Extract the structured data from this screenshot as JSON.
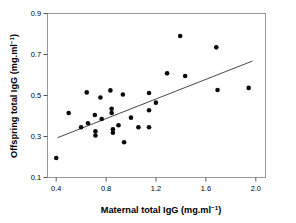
{
  "chart_data": {
    "type": "scatter",
    "title": "",
    "xlabel": "Maternal total IgG (mg.ml-1)",
    "xlabel_main": "Maternal total IgG (mg.ml",
    "xlabel_sup": "−1",
    "xlabel_tail": ")",
    "ylabel": "Offspring total IgG (mg.ml-1)",
    "ylabel_main": "Offspring total IgG (mg.ml",
    "ylabel_sup": "−1",
    "ylabel_tail": ")",
    "xlim": [
      0.33,
      2.08
    ],
    "ylim": [
      0.1,
      0.9
    ],
    "xticks": [
      0.4,
      0.8,
      1.2,
      1.6,
      2.0
    ],
    "xtick_labels": [
      "0.4",
      "0.8",
      "1.2",
      "1.6",
      "2.0"
    ],
    "yticks": [
      0.1,
      0.3,
      0.5,
      0.7,
      0.9
    ],
    "ytick_labels": [
      "0.1",
      "0.3",
      "0.5",
      "0.7",
      "0.9"
    ],
    "grid": false,
    "legend": "none",
    "marker": "filled-circle",
    "marker_color": "#0a0a0a",
    "marker_size": 4.6,
    "points": [
      {
        "x": 0.4,
        "y": 0.195
      },
      {
        "x": 0.5,
        "y": 0.415
      },
      {
        "x": 0.6,
        "y": 0.345
      },
      {
        "x": 0.645,
        "y": 0.515
      },
      {
        "x": 0.655,
        "y": 0.365
      },
      {
        "x": 0.71,
        "y": 0.405
      },
      {
        "x": 0.715,
        "y": 0.325
      },
      {
        "x": 0.715,
        "y": 0.305
      },
      {
        "x": 0.755,
        "y": 0.49
      },
      {
        "x": 0.765,
        "y": 0.385
      },
      {
        "x": 0.835,
        "y": 0.525
      },
      {
        "x": 0.845,
        "y": 0.435
      },
      {
        "x": 0.845,
        "y": 0.415
      },
      {
        "x": 0.855,
        "y": 0.335
      },
      {
        "x": 0.855,
        "y": 0.318
      },
      {
        "x": 0.9,
        "y": 0.355
      },
      {
        "x": 0.935,
        "y": 0.505
      },
      {
        "x": 0.945,
        "y": 0.272
      },
      {
        "x": 1.0,
        "y": 0.392
      },
      {
        "x": 1.06,
        "y": 0.345
      },
      {
        "x": 1.145,
        "y": 0.512
      },
      {
        "x": 1.145,
        "y": 0.428
      },
      {
        "x": 1.145,
        "y": 0.345
      },
      {
        "x": 1.2,
        "y": 0.465
      },
      {
        "x": 1.29,
        "y": 0.608
      },
      {
        "x": 1.395,
        "y": 0.79
      },
      {
        "x": 1.435,
        "y": 0.595
      },
      {
        "x": 1.685,
        "y": 0.735
      },
      {
        "x": 1.695,
        "y": 0.527
      },
      {
        "x": 1.945,
        "y": 0.537
      }
    ],
    "fit_line": {
      "type": "linear-regression",
      "x_start": 0.41,
      "y_start": 0.294,
      "x_end": 1.975,
      "y_end": 0.668
    }
  }
}
